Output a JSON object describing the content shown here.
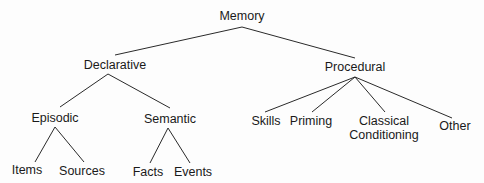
{
  "diagram": {
    "type": "tree",
    "root": "Memory",
    "nodes": {
      "memory": "Memory",
      "declarative": "Declarative",
      "procedural": "Procedural",
      "episodic": "Episodic",
      "semantic": "Semantic",
      "skills": "Skills",
      "priming": "Priming",
      "classical_1": "Classical",
      "classical_2": "Conditioning",
      "other": "Other",
      "items": "Items",
      "sources": "Sources",
      "facts": "Facts",
      "events": "Events"
    },
    "edges": [
      [
        "Memory",
        "Declarative"
      ],
      [
        "Memory",
        "Procedural"
      ],
      [
        "Declarative",
        "Episodic"
      ],
      [
        "Declarative",
        "Semantic"
      ],
      [
        "Procedural",
        "Skills"
      ],
      [
        "Procedural",
        "Priming"
      ],
      [
        "Procedural",
        "Classical Conditioning"
      ],
      [
        "Procedural",
        "Other"
      ],
      [
        "Episodic",
        "Items"
      ],
      [
        "Episodic",
        "Sources"
      ],
      [
        "Semantic",
        "Facts"
      ],
      [
        "Semantic",
        "Events"
      ]
    ]
  }
}
